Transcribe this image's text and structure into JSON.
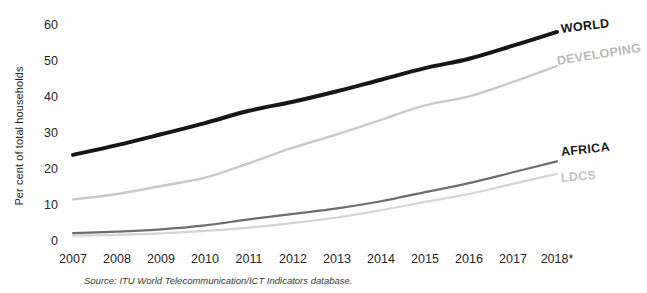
{
  "chart_data": {
    "type": "line",
    "title": "",
    "subtitle": "",
    "xlabel": "",
    "ylabel": "Per cent of total households",
    "x": [
      "2007",
      "2008",
      "2009",
      "2010",
      "2011",
      "2012",
      "2013",
      "2014",
      "2015",
      "2016",
      "2017",
      "2018*"
    ],
    "xlim": [
      "2007",
      "2018*"
    ],
    "ylim": [
      0,
      60
    ],
    "yticks": [
      0,
      10,
      20,
      30,
      40,
      50,
      60
    ],
    "grid": false,
    "legend_position": "right-inline-labels",
    "series": [
      {
        "name": "WORLD",
        "color": "#161616",
        "width": 4.0,
        "values": [
          23.8,
          26.5,
          29.5,
          32.6,
          36.0,
          38.5,
          41.4,
          44.6,
          47.8,
          50.4,
          54.0,
          57.8
        ]
      },
      {
        "name": "DEVELOPING",
        "color": "#c9c9c9",
        "width": 2.4,
        "values": [
          11.5,
          13.0,
          15.2,
          17.5,
          21.5,
          25.8,
          29.5,
          33.5,
          37.5,
          40.0,
          44.0,
          48.4
        ]
      },
      {
        "name": "AFRICA",
        "color": "#6e6e6e",
        "width": 2.2,
        "values": [
          2.2,
          2.6,
          3.2,
          4.3,
          6.0,
          7.5,
          9.0,
          11.0,
          13.5,
          16.0,
          19.0,
          22.0
        ]
      },
      {
        "name": "LDCS",
        "color": "#d4d4d4",
        "width": 2.2,
        "values": [
          1.5,
          1.7,
          2.1,
          2.8,
          3.7,
          5.0,
          6.5,
          8.5,
          10.8,
          13.0,
          15.8,
          18.6
        ]
      }
    ],
    "annotations": {
      "footnote_marker": "*",
      "source": "Source: ITU World Telecommunication/ICT Indicators database."
    }
  },
  "axis": {
    "y_title": "Per cent of total households",
    "y_ticks": [
      "60",
      "50",
      "40",
      "30",
      "20",
      "10",
      "0"
    ],
    "x_ticks": [
      "2007",
      "2008",
      "2009",
      "2010",
      "2011",
      "2012",
      "2013",
      "2014",
      "2015",
      "2016",
      "2017",
      "2018*"
    ]
  },
  "series_labels": {
    "world": "WORLD",
    "developing": "DEVELOPING",
    "africa": "AFRICA",
    "ldcs": "LDCS"
  },
  "source": "Source: ITU World Telecommunication/ICT Indicators database."
}
